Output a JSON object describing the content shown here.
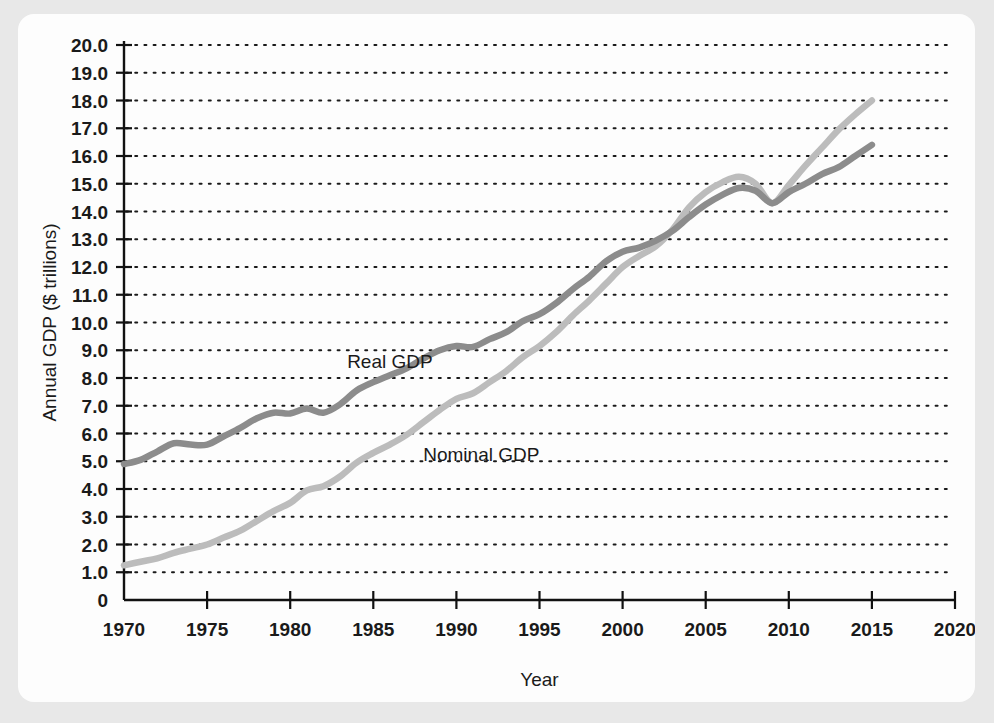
{
  "card": {
    "background_color": "#fdfdfd",
    "page_background_color": "#e8e8e8"
  },
  "chart_data": {
    "type": "line",
    "title": "",
    "xlabel": "Year",
    "ylabel": "Annual GDP ($ trillions)",
    "xlim": [
      1970,
      2020
    ],
    "ylim": [
      0,
      20
    ],
    "xticks": [
      1970,
      1975,
      1980,
      1985,
      1990,
      1995,
      2000,
      2005,
      2010,
      2015,
      2020
    ],
    "xtick_labels": [
      "1970",
      "1975",
      "1980",
      "1985",
      "1990",
      "1995",
      "2000",
      "2005",
      "2010",
      "2015",
      "2020"
    ],
    "yticks": [
      0,
      1,
      2,
      3,
      4,
      5,
      6,
      7,
      8,
      9,
      10,
      11,
      12,
      13,
      14,
      15,
      16,
      17,
      18,
      19,
      20
    ],
    "ytick_labels": [
      "0",
      "1.0",
      "2.0",
      "3.0",
      "4.0",
      "5.0",
      "6.0",
      "7.0",
      "8.0",
      "9.0",
      "10.0",
      "11.0",
      "12.0",
      "13.0",
      "14.0",
      "15.0",
      "16.0",
      "17.0",
      "18.0",
      "19.0",
      "20.0"
    ],
    "grid": true,
    "grid_style": "dotted-horizontal",
    "legend": "inline-annotations",
    "x": [
      1970,
      1971,
      1972,
      1973,
      1974,
      1975,
      1976,
      1977,
      1978,
      1979,
      1980,
      1981,
      1982,
      1983,
      1984,
      1985,
      1986,
      1987,
      1988,
      1989,
      1990,
      1991,
      1992,
      1993,
      1994,
      1995,
      1996,
      1997,
      1998,
      1999,
      2000,
      2001,
      2002,
      2003,
      2004,
      2005,
      2006,
      2007,
      2008,
      2009,
      2010,
      2011,
      2012,
      2013,
      2014,
      2015
    ],
    "series": [
      {
        "name": "Real GDP",
        "color": "#8c8c8c",
        "label_x": 1986,
        "label_y": 8.35,
        "values": [
          4.9,
          5.05,
          5.35,
          5.65,
          5.6,
          5.6,
          5.9,
          6.2,
          6.55,
          6.75,
          6.72,
          6.9,
          6.75,
          7.05,
          7.55,
          7.85,
          8.1,
          8.35,
          8.7,
          9.0,
          9.15,
          9.12,
          9.4,
          9.65,
          10.05,
          10.3,
          10.7,
          11.2,
          11.65,
          12.2,
          12.55,
          12.7,
          12.95,
          13.3,
          13.8,
          14.25,
          14.6,
          14.85,
          14.75,
          14.3,
          14.7,
          15.0,
          15.35,
          15.6,
          16.0,
          16.4
        ]
      },
      {
        "name": "Nominal GDP",
        "color": "#bcbcbc",
        "label_x": 1991.5,
        "label_y": 5.0,
        "values": [
          1.25,
          1.38,
          1.5,
          1.7,
          1.85,
          2.0,
          2.25,
          2.5,
          2.85,
          3.2,
          3.5,
          3.95,
          4.1,
          4.45,
          4.95,
          5.3,
          5.6,
          5.95,
          6.4,
          6.85,
          7.25,
          7.45,
          7.85,
          8.25,
          8.75,
          9.15,
          9.65,
          10.25,
          10.8,
          11.4,
          12.0,
          12.4,
          12.75,
          13.35,
          14.15,
          14.7,
          15.05,
          15.25,
          15.0,
          14.3,
          14.95,
          15.65,
          16.3,
          16.95,
          17.5,
          18.0
        ]
      }
    ]
  }
}
